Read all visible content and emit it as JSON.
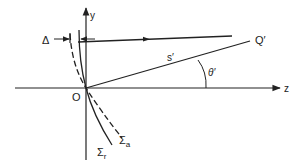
{
  "diagram": {
    "type": "optics-geometry",
    "axes": {
      "z_label": "z",
      "y_label": "y",
      "origin_label": "O"
    },
    "labels": {
      "delta": "Δ",
      "point": "Q′",
      "distance": "s′",
      "angle": "θ′",
      "surface_a": "Σ",
      "surface_a_sub": "a",
      "surface_r": "Σ",
      "surface_r_sub": "r"
    },
    "colors": {
      "stroke": "#222222",
      "background": "#ffffff"
    }
  }
}
